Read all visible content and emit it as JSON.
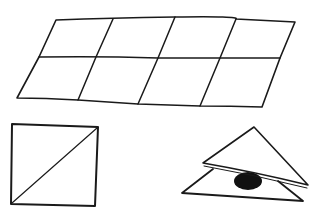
{
  "figure": {
    "ink_color": "#1a1a1a",
    "background_color": "#ffffff",
    "blob_color": "#111111"
  },
  "grid": {
    "rows": 2,
    "columns": 4
  },
  "square": {
    "divided_by": "diagonal"
  },
  "triangles": {
    "count": 2,
    "hidden_object": "dark blob"
  }
}
